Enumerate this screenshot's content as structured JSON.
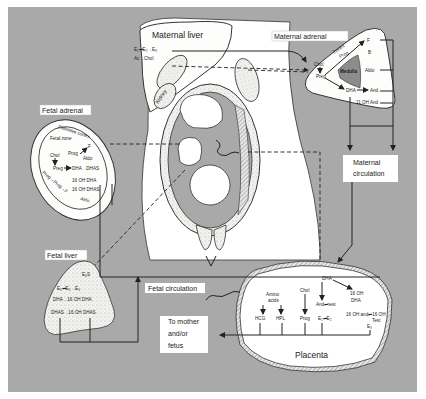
{
  "figure": {
    "background_color": "#a9a9a9",
    "paper_color": "#ffffff",
    "ink_color": "#222222"
  },
  "labels": {
    "maternal_liver": "Maternal liver",
    "maternal_adrenal": "Maternal adrenal",
    "fetal_adrenal": "Fetal adrenal",
    "fetal_liver": "Fetal liver",
    "kidney": "Kidney",
    "maternal_circulation_line1": "Maternal",
    "maternal_circulation_line2": "circulation",
    "fetal_circulation": "Fetal circulation",
    "to_mother_line1": "To mother",
    "to_mother_line2": "and/or",
    "to_mother_line3": "fetus",
    "placenta": "Placenta"
  },
  "maternal_liver": {
    "reaction1": "E₁⇌E₂→E₃",
    "reaction2": "Ac→Chol"
  },
  "maternal_adrenal": {
    "cortex": "Cortex",
    "medulla": "Medulla",
    "chol": "Chol",
    "preg": "Preg",
    "prog": "Prog",
    "f": "F",
    "b": "B",
    "aldo": "Aldo",
    "dha": "DHA",
    "and": "And",
    "oh_and": "11 OH And"
  },
  "fetal_adrenal": {
    "definitive_cortex": "Definitive cortex",
    "fetal_zone": "Fetal zone",
    "chol": "Chol",
    "prog": "Prog",
    "f": "F",
    "aldo_inner": "Aldo",
    "preg": "Preg",
    "dha_dhas": "DHA→DHAS",
    "oh_dha": "16 OH DHA",
    "oh_dhas": "16 OH DHAS",
    "outer_chain": "Preg→Prog→F",
    "outer_aldo": "Aldo"
  },
  "fetal_liver": {
    "e3s": "E₃S",
    "estrogens": "E₁⇌E₂→E₃",
    "row1": "DHA→16 OH DHA",
    "row2": "DHAS→16 OH DHAS"
  },
  "placenta": {
    "dha": "DHA",
    "amino": "Amino",
    "acids": "acids",
    "chol": "Chol",
    "hcg": "HCG",
    "hpl": "HPL",
    "prog": "Prog",
    "and_test": "And⇌test",
    "e1e2": "E₁⇌E₂",
    "oh_dha_1": "16 OH",
    "oh_dha_2": "DHA",
    "oh_and": "16 OH and⇌16 OH",
    "test": "Test",
    "e3": "E₃"
  }
}
